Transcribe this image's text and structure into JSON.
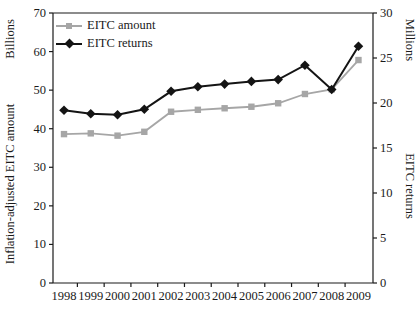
{
  "figure": {
    "background": "#ffffff",
    "text_color": "#1a1a1a",
    "axis_color": "#1a1a1a"
  },
  "axes": {
    "left": {
      "unit_label": "Billions",
      "title": "Inflation-adjusted EITC amount"
    },
    "right": {
      "unit_label": "Millions",
      "title": "EITC returns"
    }
  },
  "chart_data": {
    "type": "line",
    "title": "",
    "x_categories": [
      "1998",
      "1999",
      "2000",
      "2001",
      "2002",
      "2003",
      "2004",
      "2005",
      "2006",
      "2007",
      "2008",
      "2009"
    ],
    "left_axis": {
      "label": "Inflation-adjusted EITC amount",
      "unit": "Billions",
      "ylim": [
        0,
        70
      ],
      "ticks": [
        0,
        10,
        20,
        30,
        40,
        50,
        60,
        70
      ]
    },
    "right_axis": {
      "label": "EITC returns",
      "unit": "Millions",
      "ylim": [
        0,
        30
      ],
      "ticks": [
        0,
        5,
        10,
        15,
        20,
        25,
        30
      ]
    },
    "grid": false,
    "legend_position": "top-left-inside",
    "series": [
      {
        "name": "EITC amount",
        "axis": "left",
        "marker": "square",
        "color": "#a6a6a6",
        "values": [
          38.6,
          38.8,
          38.2,
          39.2,
          44.4,
          44.9,
          45.3,
          45.7,
          46.6,
          49.0,
          50.2,
          57.8
        ]
      },
      {
        "name": "EITC returns",
        "axis": "right",
        "marker": "diamond",
        "color": "#141414",
        "values": [
          19.2,
          18.8,
          18.7,
          19.3,
          21.3,
          21.8,
          22.1,
          22.4,
          22.6,
          24.2,
          21.5,
          26.3
        ]
      }
    ]
  }
}
